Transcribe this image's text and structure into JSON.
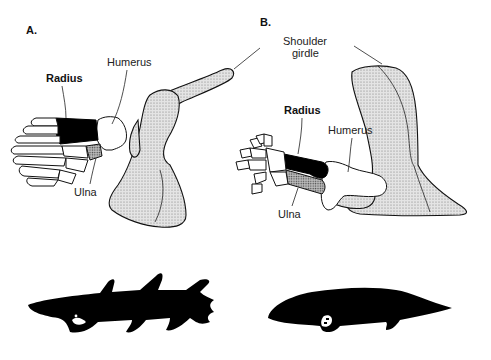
{
  "panels": {
    "a": {
      "letter": "A.",
      "labels": {
        "humerus": "Humerus",
        "radius": "Radius",
        "ulna": "Ulna"
      },
      "silhouette": "lobe-finned-fish"
    },
    "b": {
      "letter": "B.",
      "labels": {
        "shoulder_girdle_line1": "Shoulder",
        "shoulder_girdle_line2": "girdle",
        "humerus": "Humerus",
        "radius": "Radius",
        "ulna": "Ulna"
      },
      "silhouette": "early-tetrapod"
    }
  },
  "colors": {
    "ink": "#111111",
    "stipple_fill": "#d9d9d9",
    "radius_fill": "#000000",
    "background": "#ffffff"
  }
}
